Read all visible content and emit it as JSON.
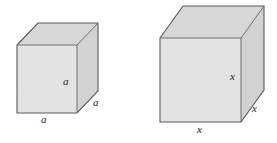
{
  "figure": {
    "colors": {
      "top_face": "#d7d7d7",
      "front_face": "#e3e3e3",
      "side_face": "#d2d2d2",
      "edge_stroke": "#5a5a5a",
      "label_color": "#1a1a1a",
      "background": "#ffffff"
    },
    "shapes": [
      {
        "name": "small-cube",
        "label_symbol": "a",
        "labels": [
          {
            "id": "depth",
            "text": "a",
            "position": "front-face-right-inner"
          },
          {
            "id": "height",
            "text": "a",
            "position": "right-side-face"
          },
          {
            "id": "width",
            "text": "a",
            "position": "below-front-face"
          }
        ]
      },
      {
        "name": "large-cube",
        "label_symbol": "x",
        "labels": [
          {
            "id": "depth",
            "text": "x",
            "position": "front-face-right-inner"
          },
          {
            "id": "height",
            "text": "x",
            "position": "right-side-face"
          },
          {
            "id": "width",
            "text": "x",
            "position": "below-front-face"
          }
        ]
      }
    ],
    "small_cube_labels": {
      "inner": "a",
      "side": "a",
      "bottom": "a"
    },
    "large_cube_labels": {
      "inner": "x",
      "side": "x",
      "bottom": "x"
    }
  }
}
